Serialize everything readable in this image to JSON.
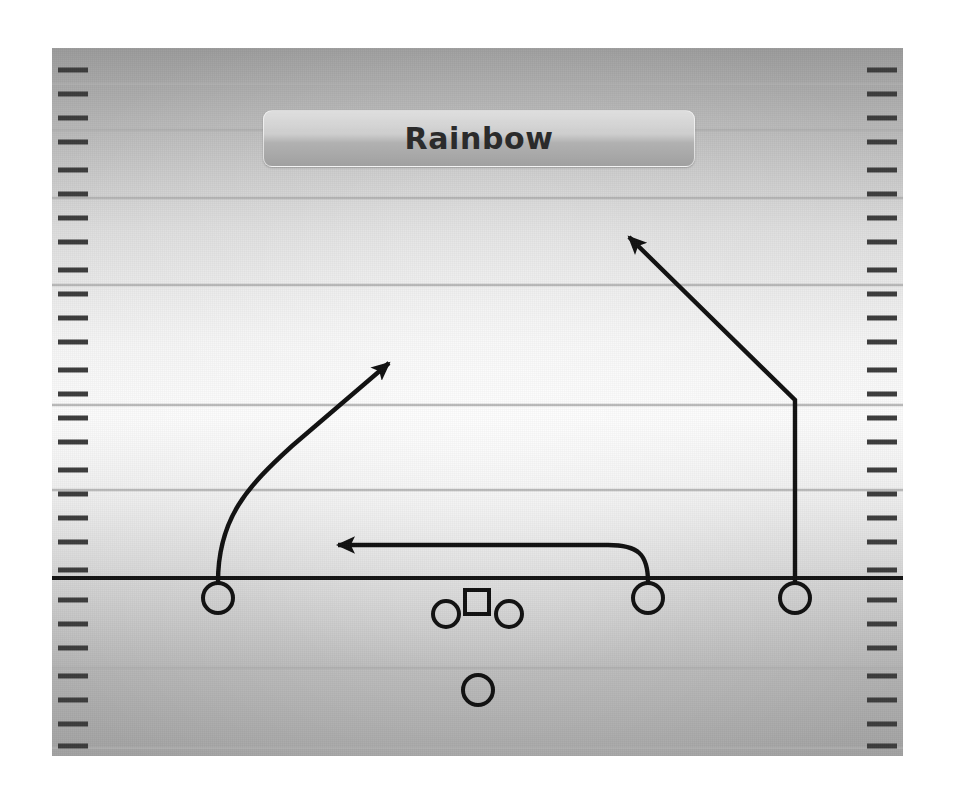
{
  "diagram": {
    "type": "american-football-play-diagram",
    "title": "Rainbow",
    "field": {
      "background_top_color": "#9d9d9d",
      "background_mid_color": "#fbfbfb",
      "background_bottom_color": "#a4a4a4",
      "yard_line_color": "#b4b4b4",
      "line_of_scrimmage_color": "#1a1a1a",
      "hash_mark_color": "#3a3a3a",
      "yard_lines_y": [
        36,
        82,
        150,
        237,
        357,
        442,
        530
      ],
      "line_of_scrimmage_y": 530,
      "hash_groups": 7,
      "hash_per_group": 4
    },
    "players": [
      {
        "id": "wr-left",
        "label": "left receiver",
        "shape": "circle",
        "x": 166,
        "y": 550,
        "r": 15
      },
      {
        "id": "ol-left",
        "label": "left lineman",
        "shape": "circle",
        "x": 394,
        "y": 566,
        "r": 13
      },
      {
        "id": "center",
        "label": "center with ball",
        "shape": "square",
        "x": 425,
        "y": 554,
        "size": 24
      },
      {
        "id": "ol-right",
        "label": "right lineman",
        "shape": "circle",
        "x": 457,
        "y": 566,
        "r": 13
      },
      {
        "id": "wr-slot",
        "label": "slot receiver",
        "shape": "circle",
        "x": 596,
        "y": 550,
        "r": 15
      },
      {
        "id": "wr-right",
        "label": "right receiver",
        "shape": "circle",
        "x": 743,
        "y": 550,
        "r": 15
      },
      {
        "id": "quarterback",
        "label": "quarterback",
        "shape": "circle",
        "x": 426,
        "y": 642,
        "r": 15
      }
    ],
    "routes": [
      {
        "id": "route-rainbow-left",
        "label": "left receiver rainbow arc route",
        "style": "solid",
        "arrow": "filled-triangle",
        "path": "M 166 534 C 166 470, 196 438, 240 398 L 334 318"
      },
      {
        "id": "route-drag",
        "label": "slot receiver drag route",
        "style": "solid",
        "arrow": "filled-triangle",
        "path": "M 596 534 C 596 506, 586 497, 556 497 L 281 497"
      },
      {
        "id": "route-corner-right",
        "label": "right receiver corner route",
        "style": "solid",
        "arrow": "filled-triangle",
        "path": "M 743 534 L 743 352 L 573 185"
      }
    ]
  }
}
